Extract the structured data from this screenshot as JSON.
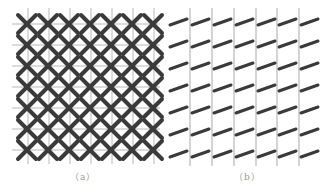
{
  "figure": {
    "panels": [
      {
        "id": "a",
        "label": "（a）",
        "pattern": "crossed-x-lattice",
        "rows": 7,
        "cols": 7,
        "grid_color": "#b8b8b8",
        "mark_color": "#3a3a3a"
      },
      {
        "id": "b",
        "label": "（b）",
        "pattern": "tilted-dash-lattice",
        "rows": 7,
        "cols": 7,
        "grid_color": "#b8b8b8",
        "mark_color": "#3a3a3a"
      }
    ]
  }
}
